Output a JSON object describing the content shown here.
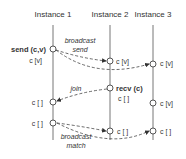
{
  "instances": [
    {
      "label": "Instance 1",
      "x": 53
    },
    {
      "label": "Instance 2",
      "x": 110
    },
    {
      "label": "Instance 3",
      "x": 153
    }
  ],
  "events": {
    "send_label": "send (c,v)",
    "i1_cv": "c [v]",
    "i2_cv": "c [v]",
    "i3_cv": "c [v]",
    "recv_label": "recv (c)",
    "i2_empty_after_recv": "c [ ]",
    "i1_empty_join": "c [ ]",
    "i3_cv_later": "c [v]",
    "i1_empty_match": "c [ ]",
    "i2_empty_match": "c [ ]",
    "i3_empty_match": "c [ ]"
  },
  "messages": {
    "broadcast_send_line1": "broadcast",
    "broadcast_send_line2": "send",
    "join": "join",
    "broadcast_match_line1": "broadcast",
    "broadcast_match_line2": "match"
  },
  "colors": {
    "line": "#666666",
    "text": "#333333",
    "arrow": "#444444"
  }
}
